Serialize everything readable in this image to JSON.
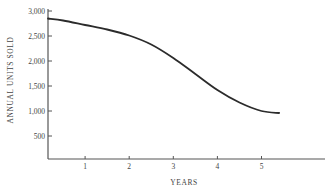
{
  "chart_data": {
    "type": "line",
    "title": "",
    "xlabel": "YEARS",
    "ylabel": "ANNUAL UNITS SOLD",
    "xlim": [
      0.15,
      6.4
    ],
    "ylim": [
      80,
      3000
    ],
    "x_ticks": [
      1,
      2,
      3,
      4,
      5
    ],
    "x_tick_labels": [
      "1",
      "2",
      "3",
      "4",
      "5"
    ],
    "y_ticks": [
      500,
      1000,
      1500,
      2000,
      2500,
      3000
    ],
    "y_tick_labels": [
      "500",
      "1,000",
      "1,500",
      "2,000",
      "2,500",
      "3,000"
    ],
    "grid": false,
    "legend": null,
    "series": [
      {
        "name": "Annual units sold",
        "x": [
          0.15,
          0.5,
          1.0,
          1.5,
          2.0,
          2.5,
          3.0,
          3.5,
          4.0,
          4.5,
          5.0,
          5.4
        ],
        "values": [
          2850,
          2810,
          2720,
          2630,
          2510,
          2330,
          2060,
          1740,
          1420,
          1170,
          1000,
          960
        ]
      }
    ],
    "line_color": "#2b2b2b"
  }
}
